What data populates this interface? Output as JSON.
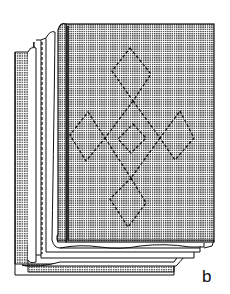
{
  "figure": {
    "label": "b",
    "colors": {
      "ink": "#111111",
      "fill_dots": "#8a8a8a",
      "paper": "#ffffff"
    }
  }
}
